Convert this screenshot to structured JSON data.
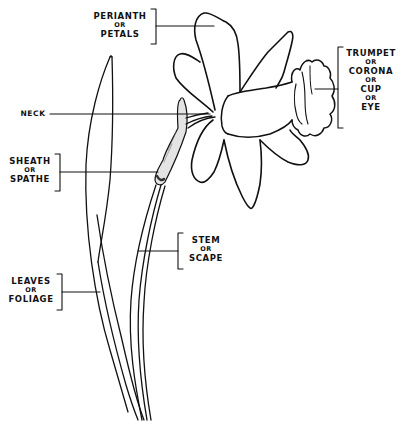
{
  "diagram": {
    "line_color": "#111111",
    "background": "#ffffff",
    "labels": {
      "perianth": {
        "primary": "PERIANTH",
        "conj": "OR",
        "secondary": "PETALS"
      },
      "trumpet": {
        "primary": "TRUMPET",
        "conj1": "OR",
        "secondary": "CORONA",
        "conj2": "OR",
        "tertiary": "CUP",
        "conj3": "OR",
        "quaternary": "EYE"
      },
      "neck": {
        "primary": "NECK"
      },
      "sheath": {
        "primary": "SHEATH",
        "conj": "OR",
        "secondary": "SPATHE"
      },
      "stem": {
        "primary": "STEM",
        "conj": "OR",
        "secondary": "SCAPE"
      },
      "leaves": {
        "primary": "LEAVES",
        "conj": "OR",
        "secondary": "FOLIAGE"
      }
    }
  }
}
